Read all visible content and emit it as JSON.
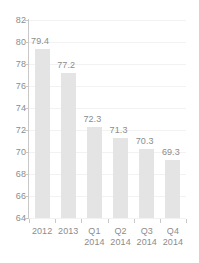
{
  "chart_data": {
    "type": "bar",
    "title": "",
    "subtitle": "",
    "xlabel": "",
    "ylabel": "",
    "categories": [
      "2012",
      "2013",
      "Q1 2014",
      "Q2 2014",
      "Q3 2014",
      "Q4 2014"
    ],
    "category_lines": [
      {
        "line1": "2012",
        "line2": ""
      },
      {
        "line1": "2013",
        "line2": ""
      },
      {
        "line1": "Q1",
        "line2": "2014"
      },
      {
        "line1": "Q2",
        "line2": "2014"
      },
      {
        "line1": "Q3",
        "line2": "2014"
      },
      {
        "line1": "Q4",
        "line2": "2014"
      }
    ],
    "values": [
      79.4,
      77.2,
      72.3,
      71.3,
      70.3,
      69.3
    ],
    "value_labels": [
      "79.4",
      "77.2",
      "72.3",
      "71.3",
      "70.3",
      "69.3"
    ],
    "ylim": [
      64,
      82
    ],
    "ytick_values": [
      82,
      80,
      78,
      76,
      74,
      72,
      70,
      68,
      66,
      64
    ],
    "ytick_labels": [
      "82",
      "80",
      "78",
      "76",
      "74",
      "72",
      "70",
      "68",
      "66",
      "64"
    ],
    "grid": true,
    "legend": false,
    "legend_position": "none",
    "colors": {
      "bar_fill": "#e4e4e4",
      "text": "#8c8c8c",
      "gridline": "#f2f2f2",
      "axis_line": "#c8c8c8",
      "background": "#ffffff"
    }
  }
}
